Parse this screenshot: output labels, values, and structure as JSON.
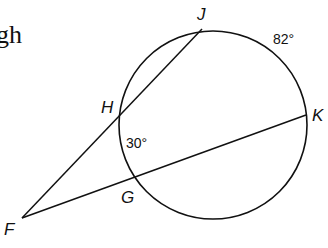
{
  "partial_text": "gh",
  "diagram": {
    "points": {
      "J": "J",
      "H": "H",
      "K": "K",
      "G": "G",
      "F": "F"
    },
    "arcs": {
      "JK": "82°",
      "HG": "30°"
    },
    "stroke_color": "#111111"
  }
}
